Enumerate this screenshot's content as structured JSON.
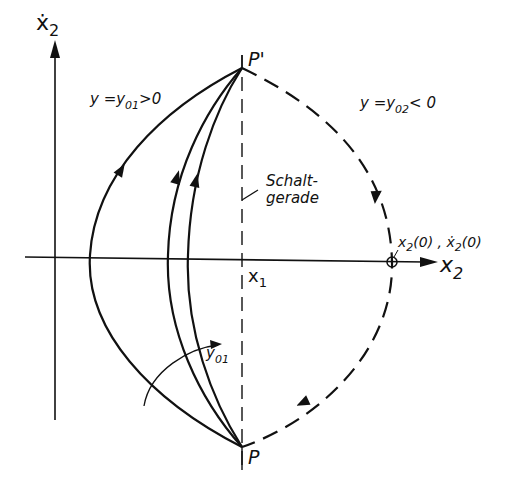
{
  "diagram": {
    "type": "phase-plane",
    "axes": {
      "horizontal_label": "x",
      "horizontal_label_sub": "2",
      "vertical_label": "ẋ",
      "vertical_label_sub": "2"
    },
    "points": {
      "p_prime": "P'",
      "p": "P",
      "x1": "x",
      "x1_sub": "1",
      "initial": "x",
      "initial_sub": "2",
      "initial_rest": "(0) , ",
      "initial_dot": "ẋ",
      "initial_dot_sub": "2",
      "initial_dot_rest": "(0)"
    },
    "regions": {
      "left_prefix": "y =y",
      "left_sub": "01",
      "left_suffix": ">0",
      "right_prefix": "y =y",
      "right_sub": "02",
      "right_suffix": "< 0"
    },
    "switching_line": {
      "line1": "Schalt-",
      "line2": "gerade"
    },
    "parameter_arrow": {
      "label": "y",
      "label_sub": "01"
    },
    "colors": {
      "ink": "#111111",
      "background": "#ffffff"
    }
  }
}
